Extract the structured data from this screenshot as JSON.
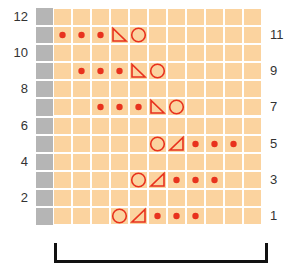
{
  "chart": {
    "rows": 12,
    "cols": 11,
    "colors": {
      "edge": "#b5b5b5",
      "cell": "#fbd39f",
      "symbol": "#e8321e",
      "bracket": "#111111"
    },
    "left_labels": [
      {
        "row": 12,
        "text": "12"
      },
      {
        "row": 10,
        "text": "10"
      },
      {
        "row": 8,
        "text": "8"
      },
      {
        "row": 6,
        "text": "6"
      },
      {
        "row": 4,
        "text": "4"
      },
      {
        "row": 2,
        "text": "2"
      }
    ],
    "right_labels": [
      {
        "row": 11,
        "text": "11"
      },
      {
        "row": 9,
        "text": "9"
      },
      {
        "row": 7,
        "text": "7"
      },
      {
        "row": 5,
        "text": "5"
      },
      {
        "row": 3,
        "text": "3"
      },
      {
        "row": 1,
        "text": "1"
      }
    ],
    "symbols": [
      {
        "row": 11,
        "col": 0,
        "type": "dot"
      },
      {
        "row": 11,
        "col": 1,
        "type": "dot"
      },
      {
        "row": 11,
        "col": 2,
        "type": "dot"
      },
      {
        "row": 11,
        "col": 3,
        "type": "triangle-left"
      },
      {
        "row": 11,
        "col": 4,
        "type": "circle"
      },
      {
        "row": 9,
        "col": 1,
        "type": "dot"
      },
      {
        "row": 9,
        "col": 2,
        "type": "dot"
      },
      {
        "row": 9,
        "col": 3,
        "type": "dot"
      },
      {
        "row": 9,
        "col": 4,
        "type": "triangle-left"
      },
      {
        "row": 9,
        "col": 5,
        "type": "circle"
      },
      {
        "row": 7,
        "col": 2,
        "type": "dot"
      },
      {
        "row": 7,
        "col": 3,
        "type": "dot"
      },
      {
        "row": 7,
        "col": 4,
        "type": "dot"
      },
      {
        "row": 7,
        "col": 5,
        "type": "triangle-left"
      },
      {
        "row": 7,
        "col": 6,
        "type": "circle"
      },
      {
        "row": 5,
        "col": 5,
        "type": "circle"
      },
      {
        "row": 5,
        "col": 6,
        "type": "triangle-right"
      },
      {
        "row": 5,
        "col": 7,
        "type": "dot"
      },
      {
        "row": 5,
        "col": 8,
        "type": "dot"
      },
      {
        "row": 5,
        "col": 9,
        "type": "dot"
      },
      {
        "row": 3,
        "col": 4,
        "type": "circle"
      },
      {
        "row": 3,
        "col": 5,
        "type": "triangle-right"
      },
      {
        "row": 3,
        "col": 6,
        "type": "dot"
      },
      {
        "row": 3,
        "col": 7,
        "type": "dot"
      },
      {
        "row": 3,
        "col": 8,
        "type": "dot"
      },
      {
        "row": 1,
        "col": 3,
        "type": "circle"
      },
      {
        "row": 1,
        "col": 4,
        "type": "triangle-right"
      },
      {
        "row": 1,
        "col": 5,
        "type": "dot"
      },
      {
        "row": 1,
        "col": 6,
        "type": "dot"
      },
      {
        "row": 1,
        "col": 7,
        "type": "dot"
      }
    ],
    "repeat_bracket": {
      "from_col": 0,
      "to_col": 10
    }
  }
}
